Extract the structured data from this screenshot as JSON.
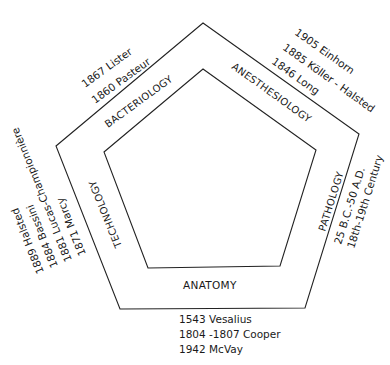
{
  "diagram": {
    "type": "nested-pentagon",
    "sides": {
      "top_left": {
        "category": "BACTERIOLOGY",
        "history": [
          "1867 Lister",
          "1860 Pasteur"
        ]
      },
      "top_right": {
        "category": "ANESTHESIOLOGY",
        "history": [
          "1905 Einhorn",
          "1885 Köller - Halsted",
          "1846 Long"
        ]
      },
      "right": {
        "category": "PATHOLOGY",
        "history": [
          "25 B.C.-50 A.D.",
          "18th-19th Century"
        ]
      },
      "bottom": {
        "category": "ANATOMY",
        "history": [
          "1543 Vesalius",
          "1804 -1807 Cooper",
          "1942 McVay"
        ]
      },
      "left": {
        "category": "TECHNOLOGY",
        "history": [
          "1889 Halsted",
          "1884 Bassini",
          "1881 Lucas-Championnière",
          "1871 Marcy"
        ]
      }
    },
    "colors": {
      "line": "#222222",
      "text": "#1a1a1a",
      "background": "#ffffff"
    }
  }
}
